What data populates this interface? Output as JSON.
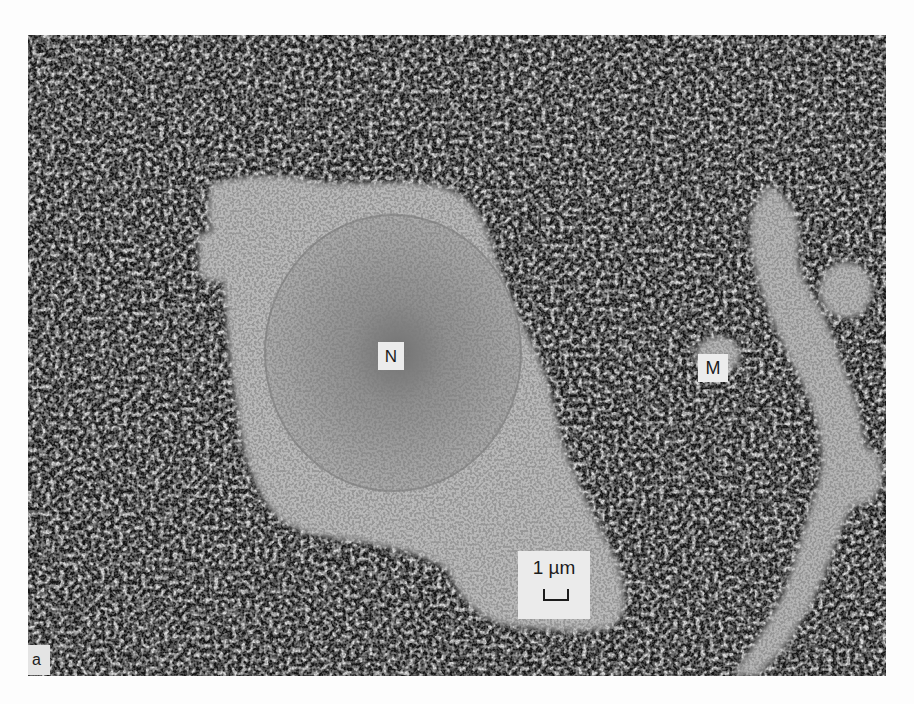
{
  "figure": {
    "panel_label": "a",
    "labels": {
      "nucleus": "N",
      "structure": "M"
    },
    "scale_bar": {
      "text": "1 µm"
    },
    "colors": {
      "background_page": "#fdfdfd",
      "dense_granular": "#1a1a1a",
      "cytoplasm": "#b8b8b8",
      "nucleus": "#a8a8a8",
      "label_box": "#ececec"
    }
  }
}
